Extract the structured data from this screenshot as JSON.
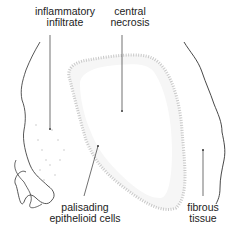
{
  "diagram": {
    "labels": {
      "inflammatory_infiltrate": [
        "inflammatory",
        "infiltrate"
      ],
      "central_necrosis": [
        "central",
        "necrosis"
      ],
      "palisading_epithelioid_cells": [
        "palisading",
        "epithelioid cells"
      ],
      "fibrous_tissue": [
        "fibrous",
        "tissue"
      ]
    }
  }
}
